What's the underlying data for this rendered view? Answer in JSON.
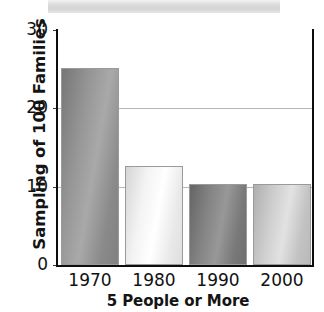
{
  "banner": {
    "label": ""
  },
  "chart_data": {
    "type": "bar",
    "title": "",
    "subtitle": "",
    "categories": [
      "1970",
      "1980",
      "1990",
      "2000"
    ],
    "values": [
      25.1,
      12.7,
      10.3,
      10.3
    ],
    "xlabel": "5 People or More",
    "ylabel": "Sampling of 100 Families",
    "ylim": [
      0,
      30
    ],
    "yticks": [
      "0",
      "10",
      "20",
      "30"
    ],
    "ytick_values": [
      0,
      10,
      20,
      30
    ],
    "grid": "horizontal",
    "legend": "none",
    "bar_colors": [
      "#8f8f8f",
      "#eeeeee",
      "#7e7e7e",
      "#c8c8c8"
    ],
    "bar_edge_color": "#9a9a9a",
    "grid_color": "#b5b5b5",
    "axis_color": "#0d0d0d",
    "background": "#ffffff"
  }
}
